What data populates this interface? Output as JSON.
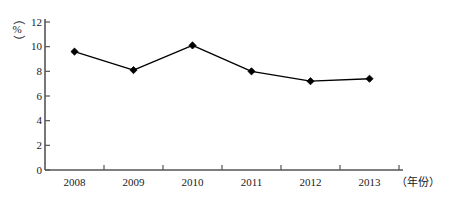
{
  "chart_data": {
    "type": "line",
    "title": "",
    "subtitle": "",
    "xlabel": "（年份）",
    "ylabel": "（%）",
    "categories": [
      "2008",
      "2009",
      "2010",
      "2011",
      "2012",
      "2013"
    ],
    "x": [
      2008,
      2009,
      2010,
      2011,
      2012,
      2013
    ],
    "series": [
      {
        "name": "",
        "values": [
          9.6,
          8.1,
          10.1,
          8.0,
          7.2,
          7.4
        ],
        "marker": "diamond",
        "color": "#000000"
      }
    ],
    "ylim": [
      0,
      12
    ],
    "yticks": [
      0,
      2,
      4,
      6,
      8,
      10,
      12
    ],
    "ytick_labels": [
      "0",
      "2",
      "4",
      "6",
      "8",
      "10",
      "12"
    ],
    "xtick_labels": [
      "2008",
      "2009",
      "2010",
      "2011",
      "2012",
      "2013"
    ],
    "grid": false,
    "legend": false,
    "legend_position": "none",
    "axis_color": "#555555",
    "line_color": "#000000",
    "marker_color": "#000000",
    "background": "#ffffff"
  },
  "axis": {
    "y_unit_open_paren": "（",
    "y_unit_text": "%",
    "y_unit_close_paren": "）",
    "x_unit": "（年份）"
  }
}
